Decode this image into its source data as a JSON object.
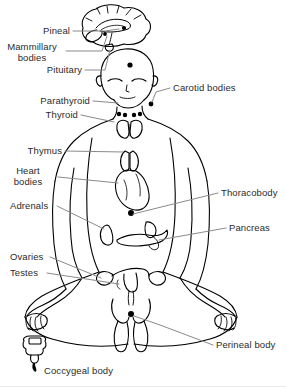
{
  "figure": {
    "type": "anatomical-diagram",
    "pose": "seated cross-legged (lotus) meditation posture, front view",
    "style": "black-and-white line drawing with gray leader lines",
    "background_color": "#ffffff",
    "line_color": "#000000",
    "leader_line_color": "#8a8a8a",
    "text_color": "#2b2b2b"
  },
  "labels_left": [
    {
      "id": "pineal",
      "text": "Pineal",
      "x": 36,
      "y": 31
    },
    {
      "id": "mammillary-bodies",
      "line1": "Mammillary",
      "line2": "bodies",
      "x": 10,
      "y": 47
    },
    {
      "id": "pituitary",
      "text": "Pituitary",
      "x": 46,
      "y": 70
    },
    {
      "id": "parathyroid",
      "text": "Parathyroid",
      "x": 32,
      "y": 101
    },
    {
      "id": "thyroid",
      "text": "Thyroid",
      "x": 45,
      "y": 115
    },
    {
      "id": "thymus",
      "text": "Thymus",
      "x": 24,
      "y": 151
    },
    {
      "id": "heart-bodies",
      "line1": "Heart",
      "line2": "bodies",
      "x": 24,
      "y": 171
    },
    {
      "id": "adrenals",
      "text": "Adrenals",
      "x": 10,
      "y": 206
    },
    {
      "id": "ovaries",
      "text": "Ovaries",
      "x": 10,
      "y": 257
    },
    {
      "id": "testes",
      "text": "Testes",
      "x": 10,
      "y": 273
    }
  ],
  "labels_right": [
    {
      "id": "carotid-bodies",
      "text": "Carotid bodies",
      "x": 173,
      "y": 88
    },
    {
      "id": "thoracobody",
      "text": "Thoracobody",
      "x": 221,
      "y": 193
    },
    {
      "id": "pancreas",
      "text": "Pancreas",
      "x": 229,
      "y": 228
    },
    {
      "id": "perineal-body",
      "text": "Perineal body",
      "x": 216,
      "y": 345
    }
  ],
  "labels_inset": [
    {
      "id": "coccygeal-body",
      "text": "Coccygeal body",
      "x": 44,
      "y": 371
    }
  ],
  "structures": [
    {
      "id": "brain-inset",
      "name": "Sagittal brain inset (top)"
    },
    {
      "id": "head",
      "name": "Head with closed eyes"
    },
    {
      "id": "pituitary-dot",
      "name": "Pituitary marker dot"
    },
    {
      "id": "carotid-dots",
      "name": "Carotid body marker dots at neck"
    },
    {
      "id": "thyroid-gland",
      "name": "Butterfly-shaped thyroid gland"
    },
    {
      "id": "parathyroid-dots",
      "name": "Parathyroid marker dots"
    },
    {
      "id": "thymus-gland",
      "name": "Thymus gland"
    },
    {
      "id": "heart",
      "name": "Heart"
    },
    {
      "id": "thoraco-dot",
      "name": "Thoracobody marker dot"
    },
    {
      "id": "adrenal-glands",
      "name": "Adrenal glands"
    },
    {
      "id": "pancreas-organ",
      "name": "Pancreas"
    },
    {
      "id": "uterus-ovaries",
      "name": "Uterus with ovaries and fallopian tubes"
    },
    {
      "id": "perineal-dot",
      "name": "Perineal body marker dot"
    },
    {
      "id": "coccyx-inset",
      "name": "Sacrum and coccyx inset (bottom left)"
    }
  ]
}
